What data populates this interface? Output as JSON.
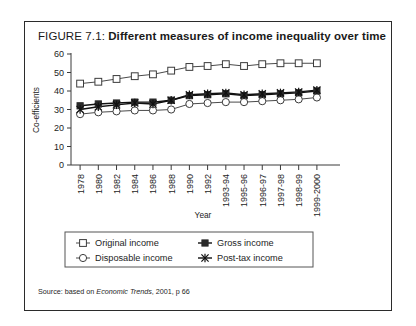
{
  "figure": {
    "label": "FIGURE 7.1:",
    "headline": "Different measures of income inequality over time",
    "source_prefix": "Source: based on ",
    "source_italic": "Economic Trends",
    "source_suffix": ", 2001, p 66"
  },
  "chart_data": {
    "type": "line",
    "title": "Different measures of income inequality over time",
    "xlabel": "Year",
    "ylabel": "Co-efficients",
    "ylim": [
      0,
      60
    ],
    "yticks": [
      0,
      10,
      20,
      30,
      40,
      50,
      60
    ],
    "grid": false,
    "legend_position": "bottom",
    "categories": [
      "1978",
      "1980",
      "1982",
      "1984",
      "1986",
      "1988",
      "1990",
      "1992",
      "1993-94",
      "1995-96",
      "1996-97",
      "1997-98",
      "1998-99",
      "1999-2000"
    ],
    "series": [
      {
        "name": "Original income",
        "marker": "open-square",
        "values": [
          44,
          45,
          46.5,
          48,
          49,
          51,
          53,
          53.5,
          54.5,
          53.5,
          54.5,
          55,
          55,
          55
        ]
      },
      {
        "name": "Gross income",
        "marker": "filled-square",
        "values": [
          32,
          33,
          33.5,
          34,
          34,
          35,
          37.5,
          38,
          38.5,
          37.5,
          38,
          38.5,
          39,
          40
        ]
      },
      {
        "name": "Disposable income",
        "marker": "open-circle",
        "values": [
          27.5,
          28.5,
          29,
          29.5,
          29.5,
          30,
          33,
          33.5,
          34,
          34,
          34.5,
          35,
          35.5,
          36.5
        ]
      },
      {
        "name": "Post-tax income",
        "marker": "star",
        "values": [
          30,
          31.5,
          32.5,
          33.5,
          33,
          35,
          38,
          38.5,
          39,
          38,
          38.5,
          39,
          39.5,
          40.5
        ]
      }
    ]
  },
  "axis": {
    "y_tick_labels": [
      "60",
      "50",
      "40",
      "30",
      "20",
      "10",
      "0"
    ],
    "y_title": "Co-efficients",
    "x_title": "Year",
    "x_tick_labels": [
      "1978",
      "1980",
      "1982",
      "1984",
      "1986",
      "1988",
      "1990",
      "1992",
      "1993-94",
      "1995-96",
      "1996-97",
      "1997-98",
      "1998-99",
      "1999-2000"
    ]
  },
  "legend": {
    "entries": [
      {
        "label": "Original income",
        "marker": "open-square"
      },
      {
        "label": "Gross income",
        "marker": "filled-square"
      },
      {
        "label": "Disposable income",
        "marker": "open-circle"
      },
      {
        "label": "Post-tax income",
        "marker": "star"
      }
    ]
  }
}
